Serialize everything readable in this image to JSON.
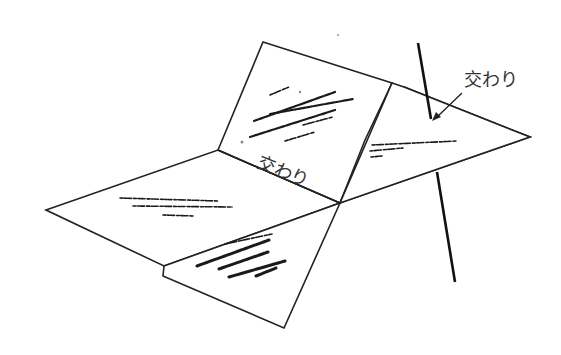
{
  "diagram": {
    "labels": {
      "plane_plane_intersection": "交わり",
      "line_plane_intersection": "交わり"
    },
    "colors": {
      "stroke": "#222222",
      "line": "#111111",
      "fill": "#ffffff",
      "text": "#333333"
    }
  }
}
